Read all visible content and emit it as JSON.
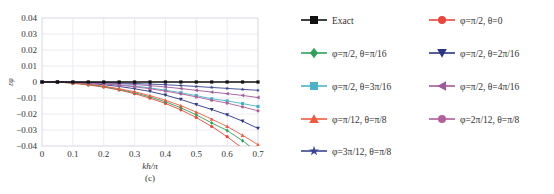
{
  "chart_data": {
    "type": "line",
    "title": "",
    "subtitle": "(c)",
    "xlabel": "kh/π",
    "ylabel": "ε_φ",
    "xlim": [
      0,
      0.7
    ],
    "ylim": [
      -0.04,
      0.04
    ],
    "grid": true,
    "legend_position": "right",
    "x_ticks": [
      "0",
      "0.1",
      "0.2",
      "0.3",
      "0.4",
      "0.5",
      "0.6",
      "0.7"
    ],
    "y_ticks": [
      "0.04",
      "0.03",
      "0.02",
      "0.01",
      "0",
      "-0.01",
      "-0.02",
      "-0.03",
      "-0.04"
    ],
    "x": [
      0,
      0.05,
      0.1,
      0.15,
      0.2,
      0.25,
      0.3,
      0.35,
      0.4,
      0.45,
      0.5,
      0.55,
      0.6,
      0.65,
      0.7
    ],
    "series": [
      {
        "name": "Exact",
        "color": "#111111",
        "marker": "square",
        "values": [
          0,
          0,
          0,
          0,
          0,
          0,
          0,
          0,
          0,
          0,
          0,
          0,
          0,
          0,
          0
        ]
      },
      {
        "name": "φ=π/2, θ=0",
        "color": "#e8463a",
        "marker": "circle",
        "values": [
          0,
          0,
          -0.0008,
          -0.0018,
          -0.0032,
          -0.005,
          -0.0073,
          -0.0101,
          -0.0134,
          -0.0174,
          -0.0222,
          -0.0278,
          -0.0342,
          -0.0415,
          -0.0498
        ]
      },
      {
        "name": "φ=π/2, θ=π/16",
        "color": "#2fa05a",
        "marker": "diamond",
        "values": [
          0,
          0,
          -0.0007,
          -0.0016,
          -0.0029,
          -0.0046,
          -0.0067,
          -0.0093,
          -0.0124,
          -0.0161,
          -0.0205,
          -0.0256,
          -0.0303,
          -0.0367,
          -0.0441
        ]
      },
      {
        "name": "φ=π/2, θ=2π/16",
        "color": "#2a3585",
        "marker": "triangle-down",
        "values": [
          0,
          0,
          -0.0004,
          -0.0009,
          -0.0017,
          -0.0028,
          -0.0042,
          -0.0059,
          -0.0082,
          -0.0109,
          -0.0141,
          -0.0172,
          -0.0205,
          -0.0245,
          -0.029
        ]
      },
      {
        "name": "φ=π/2, θ=3π/16",
        "color": "#4ab3c7",
        "marker": "square",
        "values": [
          0,
          0,
          -0.0002,
          -0.0005,
          -0.001,
          -0.0017,
          -0.0026,
          -0.0037,
          -0.0051,
          -0.0067,
          -0.0085,
          -0.0105,
          -0.0118,
          -0.0135,
          -0.0153
        ]
      },
      {
        "name": "φ=π/2, θ=4π/16",
        "color": "#a05a9a",
        "marker": "triangle-left",
        "values": [
          0,
          0,
          -0.0001,
          -0.0003,
          -0.0006,
          -0.001,
          -0.0016,
          -0.0023,
          -0.0031,
          -0.0041,
          -0.0052,
          -0.0063,
          -0.0073,
          -0.0084,
          -0.0097
        ]
      },
      {
        "name": "φ=π/12, θ=π/8",
        "color": "#f05a40",
        "marker": "triangle-up",
        "values": [
          0,
          0,
          -0.0006,
          -0.0014,
          -0.0026,
          -0.0042,
          -0.0061,
          -0.0085,
          -0.0114,
          -0.0148,
          -0.0188,
          -0.0232,
          -0.0278,
          -0.0333,
          -0.0392
        ]
      },
      {
        "name": "φ=2π/12, θ=π/8",
        "color": "#b0609a",
        "marker": "circle",
        "values": [
          0,
          0,
          -0.0002,
          -0.0006,
          -0.0012,
          -0.002,
          -0.003,
          -0.0042,
          -0.0057,
          -0.0074,
          -0.0093,
          -0.0114,
          -0.0132,
          -0.0155,
          -0.018
        ]
      },
      {
        "name": "φ=3π/12, θ=π/8",
        "color": "#3a4590",
        "marker": "star",
        "values": [
          0,
          0,
          -0.0001,
          -0.0002,
          -0.0004,
          -0.0006,
          -0.0009,
          -0.0013,
          -0.0017,
          -0.0022,
          -0.0028,
          -0.0034,
          -0.004,
          -0.0046,
          -0.0052
        ]
      }
    ]
  },
  "legend": {
    "items": [
      {
        "label": "Exact"
      },
      {
        "label": "φ=π/2, θ=0"
      },
      {
        "label": "φ=π/2, θ=π/16"
      },
      {
        "label": "φ=π/2, θ=2π/16"
      },
      {
        "label": "φ=π/2, θ=3π/16"
      },
      {
        "label": "φ=π/2, θ=4π/16"
      },
      {
        "label": "φ=π/12, θ=π/8"
      },
      {
        "label": "φ=2π/12, θ=π/8"
      },
      {
        "label": "φ=3π/12, θ=π/8"
      }
    ]
  }
}
